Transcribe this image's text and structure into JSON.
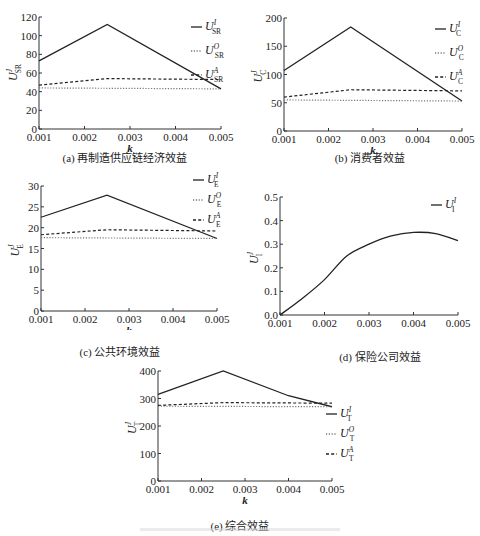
{
  "chart_data": [
    {
      "id": "a",
      "type": "line",
      "title": "",
      "caption": "(a) 再制造供应链经济效益",
      "xlabel": "k",
      "ylabel": "U_SR^J",
      "x": [
        0.001,
        0.0025,
        0.005
      ],
      "xticks": [
        "0.001",
        "0.002",
        "0.003",
        "0.004",
        "0.005"
      ],
      "yticks": [
        "0",
        "20",
        "40",
        "60",
        "80",
        "100",
        "120"
      ],
      "xlim": [
        0.001,
        0.005
      ],
      "ylim": [
        0,
        120
      ],
      "legend_position": "right",
      "series": [
        {
          "name": "U_SR^I",
          "style": "solid",
          "x": [
            0.001,
            0.0025,
            0.005
          ],
          "values": [
            73,
            112,
            43
          ]
        },
        {
          "name": "U_SR^O",
          "style": "dotted",
          "x": [
            0.001,
            0.005
          ],
          "values": [
            44,
            43
          ]
        },
        {
          "name": "U_SR^A",
          "style": "dashed",
          "x": [
            0.001,
            0.0025,
            0.005
          ],
          "values": [
            47,
            54,
            53
          ]
        }
      ]
    },
    {
      "id": "b",
      "type": "line",
      "caption": "(b) 消费者效益",
      "xlabel": "k",
      "ylabel": "U_C^J",
      "xticks": [
        "0.001",
        "0.002",
        "0.003",
        "0.004",
        "0.005"
      ],
      "yticks": [
        "0",
        "50",
        "100",
        "150",
        "200"
      ],
      "xlim": [
        0.001,
        0.005
      ],
      "ylim": [
        0,
        200
      ],
      "legend_position": "right",
      "series": [
        {
          "name": "U_C^I",
          "style": "solid",
          "x": [
            0.001,
            0.0025,
            0.005
          ],
          "values": [
            107,
            184,
            53
          ]
        },
        {
          "name": "U_C^O",
          "style": "dotted",
          "x": [
            0.001,
            0.005
          ],
          "values": [
            55,
            53
          ]
        },
        {
          "name": "U_C^A",
          "style": "dashed",
          "x": [
            0.001,
            0.0025,
            0.005
          ],
          "values": [
            60,
            73,
            71
          ]
        }
      ]
    },
    {
      "id": "c",
      "type": "line",
      "caption": "(c) 公共环境效益",
      "xlabel": "k",
      "ylabel": "U_E^J",
      "xticks": [
        "0.001",
        "0.002",
        "0.003",
        "0.004",
        "0.005"
      ],
      "yticks": [
        "0",
        "5",
        "10",
        "15",
        "20",
        "25",
        "30"
      ],
      "xlim": [
        0.001,
        0.005
      ],
      "ylim": [
        0,
        30
      ],
      "legend_position": "right",
      "series": [
        {
          "name": "U_E^I",
          "style": "solid",
          "x": [
            0.001,
            0.0025,
            0.005
          ],
          "values": [
            22.5,
            27.8,
            17.4
          ]
        },
        {
          "name": "U_E^O",
          "style": "dotted",
          "x": [
            0.001,
            0.005
          ],
          "values": [
            17.6,
            17.4
          ]
        },
        {
          "name": "U_E^A",
          "style": "dashed",
          "x": [
            0.001,
            0.0025,
            0.005
          ],
          "values": [
            18.3,
            19.5,
            19.2
          ]
        }
      ]
    },
    {
      "id": "d",
      "type": "line",
      "caption": "(d) 保险公司效益",
      "xlabel": "k",
      "ylabel": "U_I^J",
      "xticks": [
        "0.001",
        "0.002",
        "0.003",
        "0.004",
        "0.005"
      ],
      "yticks": [
        "0.0",
        "0.1",
        "0.2",
        "0.3",
        "0.4",
        "0.5"
      ],
      "xlim": [
        0.001,
        0.005
      ],
      "ylim": [
        0,
        0.5
      ],
      "legend_position": "right",
      "series": [
        {
          "name": "U_I^I",
          "style": "solid",
          "x": [
            0.001,
            0.0015,
            0.002,
            0.0025,
            0.003,
            0.0035,
            0.004,
            0.0045,
            0.005
          ],
          "values": [
            0.0,
            0.07,
            0.15,
            0.25,
            0.3,
            0.335,
            0.35,
            0.345,
            0.315
          ]
        }
      ]
    },
    {
      "id": "e",
      "type": "line",
      "caption": "(e) 综合效益",
      "xlabel": "k",
      "ylabel": "U_T^J",
      "xticks": [
        "0.001",
        "0.002",
        "0.003",
        "0.004",
        "0.005"
      ],
      "yticks": [
        "0",
        "100",
        "200",
        "300",
        "400"
      ],
      "xlim": [
        0.001,
        0.005
      ],
      "ylim": [
        0,
        400
      ],
      "legend_position": "right",
      "series": [
        {
          "name": "U_T^I",
          "style": "solid",
          "x": [
            0.001,
            0.0025,
            0.004,
            0.005
          ],
          "values": [
            315,
            400,
            310,
            270
          ]
        },
        {
          "name": "U_T^O",
          "style": "dotted",
          "x": [
            0.001,
            0.005
          ],
          "values": [
            272,
            270
          ]
        },
        {
          "name": "U_T^A",
          "style": "dashed",
          "x": [
            0.001,
            0.0025,
            0.005
          ],
          "values": [
            275,
            285,
            283
          ]
        }
      ]
    }
  ],
  "captions": {
    "a": "(a) 再制造供应链经济效益",
    "b": "(b) 消费者效益",
    "c": "(c) 公共环境效益",
    "d": "(d) 保险公司效益",
    "e": "(e) 综合效益"
  },
  "axis": {
    "xlabel": "k"
  },
  "legend": {
    "a": [
      {
        "base": "U",
        "sub": "SR",
        "sup": "I"
      },
      {
        "base": "U",
        "sub": "SR",
        "sup": "O"
      },
      {
        "base": "U",
        "sub": "SR",
        "sup": "A"
      }
    ],
    "b": [
      {
        "base": "U",
        "sub": "C",
        "sup": "I"
      },
      {
        "base": "U",
        "sub": "C",
        "sup": "O"
      },
      {
        "base": "U",
        "sub": "C",
        "sup": "A"
      }
    ],
    "c": [
      {
        "base": "U",
        "sub": "E",
        "sup": "I"
      },
      {
        "base": "U",
        "sub": "E",
        "sup": "O"
      },
      {
        "base": "U",
        "sub": "E",
        "sup": "A"
      }
    ],
    "d": [
      {
        "base": "U",
        "sub": "I",
        "sup": "I"
      }
    ],
    "e": [
      {
        "base": "U",
        "sub": "T",
        "sup": "I"
      },
      {
        "base": "U",
        "sub": "T",
        "sup": "O"
      },
      {
        "base": "U",
        "sub": "T",
        "sup": "A"
      }
    ]
  },
  "ylabels": {
    "a": {
      "base": "U",
      "sub": "SR",
      "sup": "J"
    },
    "b": {
      "base": "U",
      "sub": "C",
      "sup": "J"
    },
    "c": {
      "base": "U",
      "sub": "E",
      "sup": "J"
    },
    "d": {
      "base": "U",
      "sub": "I",
      "sup": "J"
    },
    "e": {
      "base": "U",
      "sub": "T",
      "sup": "J"
    }
  }
}
